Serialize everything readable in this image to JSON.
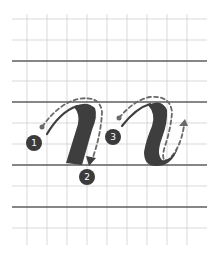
{
  "diagram": {
    "colors": {
      "ink": "#3e3e3e",
      "guide": "#6a6a6a",
      "grid_thin": "#cfcfcf",
      "grid_thick": "#5e5e5e",
      "badge": "#3b3b3b"
    },
    "steps": [
      {
        "label": "1"
      },
      {
        "label": "2"
      },
      {
        "label": "3"
      }
    ]
  }
}
